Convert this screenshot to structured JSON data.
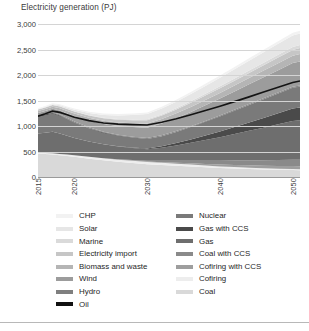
{
  "chart_data": {
    "type": "area",
    "title": "Electricity generation (PJ)",
    "xlabel": "",
    "ylabel": "Electricity generation (PJ)",
    "ylim": [
      0,
      3000
    ],
    "yticks": [
      0,
      500,
      1000,
      1500,
      2000,
      2500,
      3000
    ],
    "ytick_labels": [
      "0",
      "500",
      "1,000",
      "1,500",
      "2,000",
      "2,500",
      "3,000"
    ],
    "xlim": [
      2015,
      2051
    ],
    "xticks": [
      2015,
      2020,
      2030,
      2040,
      2050
    ],
    "xtick_labels": [
      "2015",
      "2020",
      "2030",
      "2040",
      "2050"
    ],
    "grid": true,
    "stacked": true,
    "legend_position": "bottom",
    "legend_columns": 2,
    "x": [
      2015,
      2016,
      2017,
      2018,
      2019,
      2020,
      2022,
      2024,
      2026,
      2028,
      2030,
      2032,
      2034,
      2036,
      2038,
      2040,
      2042,
      2044,
      2046,
      2048,
      2050,
      2051
    ],
    "series": [
      {
        "name": "Coal",
        "color": "#d9d9d9",
        "values": [
          455,
          450,
          440,
          425,
          410,
          395,
          360,
          330,
          300,
          275,
          250,
          235,
          220,
          205,
          190,
          175,
          165,
          155,
          145,
          140,
          135,
          132
        ]
      },
      {
        "name": "Cofiring",
        "color": "#ededed",
        "values": [
          20,
          22,
          25,
          28,
          30,
          32,
          35,
          38,
          40,
          42,
          44,
          42,
          40,
          38,
          35,
          32,
          30,
          28,
          26,
          24,
          22,
          21
        ]
      },
      {
        "name": "Cofiring with CCS",
        "color": "#9e9e9e",
        "values": [
          0,
          0,
          0,
          0,
          0,
          0,
          0,
          0,
          2,
          5,
          8,
          14,
          20,
          26,
          32,
          38,
          42,
          46,
          50,
          54,
          58,
          59
        ]
      },
      {
        "name": "Coal with CCS",
        "color": "#8a8a8a",
        "values": [
          0,
          0,
          0,
          0,
          0,
          0,
          0,
          2,
          6,
          12,
          18,
          28,
          40,
          52,
          64,
          76,
          86,
          96,
          106,
          114,
          122,
          124
        ]
      },
      {
        "name": "Gas",
        "color": "#6e6e6e",
        "values": [
          380,
          395,
          420,
          400,
          370,
          340,
          300,
          270,
          250,
          235,
          225,
          255,
          300,
          350,
          405,
          460,
          520,
          580,
          640,
          700,
          760,
          775
        ]
      },
      {
        "name": "Gas with CCS",
        "color": "#4a4a4a",
        "values": [
          0,
          0,
          0,
          0,
          0,
          0,
          0,
          0,
          4,
          10,
          16,
          28,
          45,
          65,
          88,
          112,
          138,
          165,
          192,
          218,
          245,
          252
        ]
      },
      {
        "name": "Nuclear",
        "color": "#7a7a7a",
        "values": [
          330,
          345,
          360,
          345,
          320,
          295,
          255,
          225,
          205,
          190,
          180,
          195,
          215,
          240,
          265,
          290,
          315,
          340,
          365,
          385,
          405,
          410
        ]
      },
      {
        "name": "Oil",
        "color": "#111111",
        "values": [
          12,
          12,
          11,
          10,
          9,
          8,
          7,
          6,
          5,
          5,
          4,
          4,
          4,
          3,
          3,
          3,
          3,
          3,
          2,
          2,
          2,
          2
        ]
      },
      {
        "name": "Hydro",
        "color": "#7f7f7f",
        "values": [
          16,
          16,
          16,
          16,
          16,
          16,
          17,
          17,
          17,
          17,
          18,
          18,
          18,
          18,
          18,
          19,
          19,
          19,
          19,
          20,
          20,
          20
        ]
      },
      {
        "name": "Wind",
        "color": "#9c9c9c",
        "values": [
          42,
          52,
          64,
          78,
          92,
          105,
          128,
          150,
          170,
          188,
          205,
          228,
          252,
          278,
          305,
          332,
          358,
          385,
          412,
          438,
          465,
          472
        ]
      },
      {
        "name": "Biomass and waste",
        "color": "#b5b5b5",
        "values": [
          38,
          40,
          43,
          46,
          49,
          52,
          58,
          64,
          70,
          76,
          82,
          88,
          94,
          100,
          106,
          112,
          118,
          124,
          130,
          136,
          142,
          144
        ]
      },
      {
        "name": "Electricity import",
        "color": "#c6c6c6",
        "values": [
          30,
          32,
          34,
          36,
          38,
          40,
          45,
          50,
          55,
          60,
          65,
          70,
          75,
          80,
          85,
          90,
          95,
          100,
          105,
          110,
          115,
          117
        ]
      },
      {
        "name": "Marine",
        "color": "#dadada",
        "values": [
          0,
          0,
          0,
          1,
          2,
          3,
          5,
          8,
          11,
          14,
          18,
          22,
          26,
          30,
          34,
          38,
          42,
          46,
          50,
          54,
          58,
          59
        ]
      },
      {
        "name": "Solar",
        "color": "#e6e6e6",
        "values": [
          8,
          11,
          15,
          20,
          26,
          32,
          45,
          58,
          72,
          86,
          100,
          114,
          128,
          142,
          156,
          170,
          182,
          194,
          206,
          216,
          226,
          229
        ]
      },
      {
        "name": "CHP",
        "color": "#f2f2f2",
        "values": [
          18,
          19,
          20,
          21,
          22,
          23,
          25,
          27,
          29,
          31,
          33,
          35,
          37,
          39,
          41,
          43,
          45,
          47,
          49,
          51,
          53,
          54
        ]
      }
    ],
    "totals": [
      1349,
      1394,
      1448,
      1426,
      1384,
      1341,
      1280,
      1245,
      1236,
      1246,
      1266,
      1376,
      1514,
      1666,
      1827,
      1990,
      2158,
      2328,
      2497,
      2662,
      2828,
      2870
    ],
    "oil_line": {
      "name": "Oil",
      "description": "Dark line marking cumulative level through Oil series",
      "values": [
        1193,
        1239,
        1291,
        1267,
        1220,
        1173,
        1105,
        1060,
        1037,
        1027,
        1021,
        1074,
        1142,
        1221,
        1303,
        1388,
        1478,
        1571,
        1665,
        1759,
        1855,
        1883
      ]
    }
  },
  "chart": {
    "title": "Electricity generation (PJ)"
  },
  "legend": {
    "left_column": [
      {
        "label": "CHP",
        "color": "#f2f2f2"
      },
      {
        "label": "Solar",
        "color": "#e6e6e6"
      },
      {
        "label": "Marine",
        "color": "#dadada"
      },
      {
        "label": "Electricity import",
        "color": "#c6c6c6"
      },
      {
        "label": "Biomass and waste",
        "color": "#b5b5b5"
      },
      {
        "label": "Wind",
        "color": "#9c9c9c"
      },
      {
        "label": "Hydro",
        "color": "#7f7f7f"
      },
      {
        "label": "Oil",
        "color": "#111111"
      }
    ],
    "right_column": [
      {
        "label": "Nuclear",
        "color": "#7a7a7a"
      },
      {
        "label": "Gas with CCS",
        "color": "#4a4a4a"
      },
      {
        "label": "Gas",
        "color": "#6e6e6e"
      },
      {
        "label": "Coal with CCS",
        "color": "#8a8a8a"
      },
      {
        "label": "Cofiring with CCS",
        "color": "#9e9e9e"
      },
      {
        "label": "Cofiring",
        "color": "#ededed"
      },
      {
        "label": "Coal",
        "color": "#d9d9d9"
      }
    ]
  }
}
